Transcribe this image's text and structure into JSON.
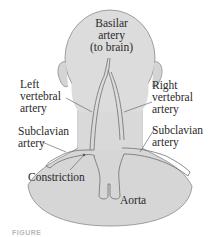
{
  "labels": {
    "basilar": [
      "Basilar",
      "artery",
      "(to brain)"
    ],
    "left_vertebral": [
      "Left",
      "vertebral",
      "artery"
    ],
    "right_vertebral": [
      "Right",
      "vertebral",
      "artery"
    ],
    "left_subclavian": [
      "Subclavian",
      "artery"
    ],
    "right_subclavian": [
      "Subclavian",
      "artery"
    ],
    "constriction": "Constriction",
    "aorta": "Aorta"
  },
  "caption": "FIGURE",
  "colors": {
    "skin": "#d9d9d9",
    "skin_outline": "#8a8a8a",
    "artery_fill": "#e6e6e6",
    "artery_outline": "#6e6e6e",
    "text": "#2a2a2a"
  }
}
